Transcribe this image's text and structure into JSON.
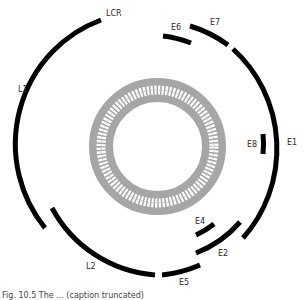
{
  "diagram": {
    "colors": {
      "arc": "#000000",
      "ring_gray": "#a6a6a6",
      "ring_teeth": "#ffffff",
      "background": "#ffffff"
    },
    "center_ring": {
      "cx": 157.5,
      "cy": 146.5,
      "inner_radius": 44.5,
      "outer_radius": 68.5,
      "tooth_count": 96
    },
    "arcs": [
      {
        "id": "L1",
        "label": "LCR/L1 outer arc",
        "d": "M101 20 A130 132 0 0 0 45 228"
      },
      {
        "id": "E6",
        "label": "E6",
        "d": "M163 36 A110 110 0 0 1 191 43"
      },
      {
        "id": "E7",
        "label": "E7",
        "d": "M190 26 A125 125 0 0 1 228 45"
      },
      {
        "id": "E1",
        "label": "E1",
        "d": "M233 49 A128 132 0 0 1 243 238"
      },
      {
        "id": "E8",
        "label": "E8",
        "d": "M263 134 A90 90 0 0 1 263 154"
      },
      {
        "id": "E4",
        "label": "E4",
        "d": "M196 235 A90 90 0 0 0 214 224"
      },
      {
        "id": "E2",
        "label": "E2",
        "d": "M196 253 A110 110 0 0 0 240 222"
      },
      {
        "id": "L2",
        "label": "L2",
        "d": "M52 208 A128 128 0 0 0 155 275"
      },
      {
        "id": "E5",
        "label": "E5",
        "d": "M162 275 A128 128 0 0 0 200 265"
      }
    ],
    "labels": [
      {
        "id": "LCR",
        "text": "LCR",
        "x": 106,
        "y": 10
      },
      {
        "id": "E6",
        "text": "E6",
        "x": 171,
        "y": 24
      },
      {
        "id": "E7",
        "text": "E7",
        "x": 210,
        "y": 19
      },
      {
        "id": "L1",
        "text": "L1",
        "x": 18,
        "y": 86
      },
      {
        "id": "E8",
        "text": "E8",
        "x": 247,
        "y": 141
      },
      {
        "id": "E1",
        "text": "E1",
        "x": 287,
        "y": 139
      },
      {
        "id": "E4",
        "text": "E4",
        "x": 195,
        "y": 218
      },
      {
        "id": "E2",
        "text": "E2",
        "x": 218,
        "y": 250
      },
      {
        "id": "L2",
        "text": "L2",
        "x": 86,
        "y": 263
      },
      {
        "id": "E5",
        "text": "E5",
        "x": 179,
        "y": 279
      }
    ],
    "caption": "Fig. 10.5  The ... (caption truncated)"
  }
}
